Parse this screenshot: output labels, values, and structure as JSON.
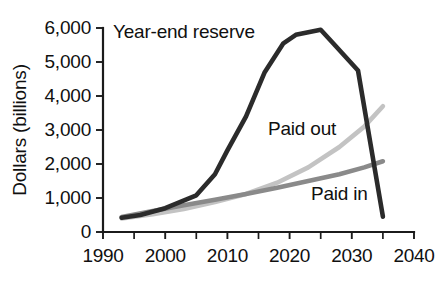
{
  "chart_data": {
    "type": "line",
    "title": "",
    "subtitle": "",
    "xlabel": "",
    "ylabel": "Dollars (billions)",
    "xlim": [
      1990,
      2040
    ],
    "ylim": [
      0,
      6000
    ],
    "grid": false,
    "legend_position": "inline-annotations",
    "x_ticks": [
      1990,
      2000,
      2010,
      2020,
      2030,
      2040
    ],
    "x_tick_labels": [
      "1990",
      "2000",
      "2010",
      "2020",
      "2030",
      "2040"
    ],
    "x_minor_ticks": [
      1995,
      2005,
      2015,
      2025,
      2035
    ],
    "y_ticks": [
      0,
      1000,
      2000,
      3000,
      4000,
      5000,
      6000
    ],
    "y_tick_labels": [
      "0",
      "1,000",
      "2,000",
      "3,000",
      "4,000",
      "5,000",
      "6,000"
    ],
    "series": [
      {
        "name": "Year-end reserve",
        "color": "#2b2b2b",
        "x": [
          1993,
          1996,
          2000,
          2005,
          2008,
          2010,
          2013,
          2016,
          2019,
          2021,
          2025,
          2027,
          2031,
          2033,
          2035
        ],
        "values": [
          420,
          500,
          700,
          1080,
          1700,
          2400,
          3400,
          4700,
          5550,
          5800,
          5950,
          5550,
          4750,
          2600,
          450
        ]
      },
      {
        "name": "Paid out",
        "color": "#c3c3c3",
        "x": [
          1993,
          1998,
          2003,
          2008,
          2013,
          2018,
          2023,
          2028,
          2032,
          2035
        ],
        "values": [
          400,
          520,
          680,
          880,
          1120,
          1450,
          1900,
          2500,
          3100,
          3700
        ]
      },
      {
        "name": "Paid in",
        "color": "#8a8a8a",
        "x": [
          1993,
          1998,
          2003,
          2008,
          2013,
          2018,
          2023,
          2028,
          2032,
          2035
        ],
        "values": [
          440,
          620,
          790,
          950,
          1120,
          1300,
          1500,
          1700,
          1900,
          2080
        ]
      }
    ],
    "annotations": [
      {
        "text": "Year-end reserve",
        "x": 2003,
        "y": 5700,
        "series": "Year-end reserve"
      },
      {
        "text": "Paid out",
        "x": 2022,
        "y": 2850,
        "series": "Paid out"
      },
      {
        "text": "Paid in",
        "x": 2028,
        "y": 950,
        "series": "Paid in"
      }
    ]
  }
}
